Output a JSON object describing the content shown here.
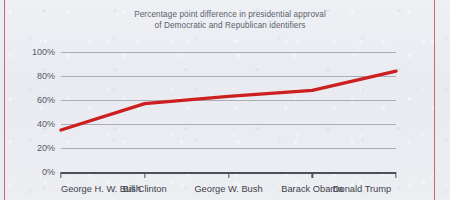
{
  "page": {
    "background_color": "#eceef3",
    "margin_rule_color": "#c94a52"
  },
  "chart_data": {
    "type": "line",
    "title": "Percentage point difference in presidential approval\nof Democratic and Republican identifiers",
    "xlabel": "",
    "ylabel": "",
    "categories": [
      "George H. W. Bush",
      "Bill Clinton",
      "George W. Bush",
      "Barack Obama",
      "Donald Trump"
    ],
    "values": [
      35,
      57,
      63,
      68,
      84
    ],
    "series": [
      {
        "name": "Percentage point difference in presidential approval of Democratic and Republican identifiers",
        "values": [
          35,
          57,
          63,
          68,
          84
        ],
        "color": "#cc2020"
      }
    ],
    "ylim": [
      0,
      100
    ],
    "yticks": [
      0,
      20,
      40,
      60,
      80,
      100
    ],
    "ytick_labels": [
      "0%",
      "20%",
      "40%",
      "60%",
      "80%",
      "100%"
    ],
    "grid": true,
    "grid_axis": "y",
    "legend": "none",
    "line_width_px": 3.4,
    "value_suffix": "%"
  }
}
